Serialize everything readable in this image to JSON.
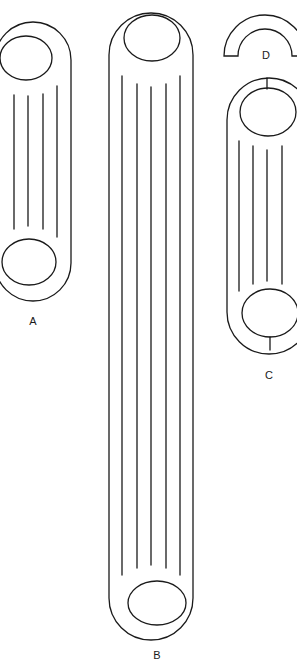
{
  "figure": {
    "width": 297,
    "height": 668,
    "stroke_color": "#1a1a1a",
    "background": "#ffffff"
  },
  "parts": [
    {
      "id": "A",
      "label": "A",
      "label_pos": [
        33,
        325
      ],
      "capsule": {
        "x": -5,
        "y": 22,
        "w": 76,
        "h": 279,
        "r": 38
      },
      "ellipses": [
        {
          "cx": 26,
          "cy": 58,
          "rx": 26,
          "ry": 22
        },
        {
          "cx": 29,
          "cy": 262,
          "rx": 27,
          "ry": 23
        }
      ],
      "lines": [
        {
          "x": 14,
          "y1": 95,
          "y2": 229
        },
        {
          "x": 28,
          "y1": 96,
          "y2": 226
        },
        {
          "x": 43,
          "y1": 94,
          "y2": 229
        },
        {
          "x": 57,
          "y1": 86,
          "y2": 237
        }
      ],
      "ticks": []
    },
    {
      "id": "B",
      "label": "B",
      "label_pos": [
        157,
        659
      ],
      "capsule": {
        "x": 109,
        "y": 13,
        "w": 84,
        "h": 627,
        "r": 42
      },
      "ellipses": [
        {
          "cx": 152,
          "cy": 38,
          "rx": 28,
          "ry": 23
        },
        {
          "cx": 157,
          "cy": 603,
          "rx": 29,
          "ry": 22
        }
      ],
      "lines": [
        {
          "x": 122,
          "y1": 76,
          "y2": 575
        },
        {
          "x": 137,
          "y1": 84,
          "y2": 568
        },
        {
          "x": 151,
          "y1": 87,
          "y2": 565
        },
        {
          "x": 166,
          "y1": 84,
          "y2": 568
        },
        {
          "x": 180,
          "y1": 76,
          "y2": 575
        }
      ],
      "ticks": []
    },
    {
      "id": "C",
      "label": "C",
      "label_pos": [
        269,
        379
      ],
      "capsule": {
        "x": 227,
        "y": 78,
        "w": 84,
        "h": 276,
        "r": 42
      },
      "ellipses": [
        {
          "cx": 268,
          "cy": 112,
          "rx": 28,
          "ry": 24
        },
        {
          "cx": 270,
          "cy": 313,
          "rx": 28,
          "ry": 24
        }
      ],
      "lines": [
        {
          "x": 239,
          "y1": 141,
          "y2": 291
        },
        {
          "x": 253,
          "y1": 146,
          "y2": 284
        },
        {
          "x": 267,
          "y1": 150,
          "y2": 281
        },
        {
          "x": 282,
          "y1": 146,
          "y2": 284
        }
      ],
      "ticks": [
        {
          "x": 267,
          "y1": 78,
          "y2": 89
        },
        {
          "x": 270,
          "y1": 337,
          "y2": 350
        }
      ]
    },
    {
      "id": "D",
      "label": "D",
      "label_pos": [
        266,
        59
      ],
      "half_ring": {
        "cx": 265,
        "cy": 56,
        "r_outer": 41,
        "r_inner": 27
      }
    }
  ]
}
